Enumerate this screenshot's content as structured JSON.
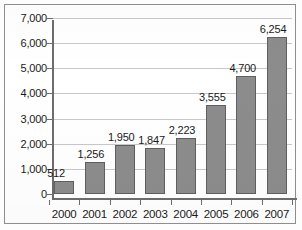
{
  "chart_data": {
    "type": "bar",
    "title": "",
    "xlabel": "",
    "ylabel": "",
    "categories": [
      "2000",
      "2001",
      "2002",
      "2003",
      "2004",
      "2005",
      "2006",
      "2007"
    ],
    "values": [
      512,
      1256,
      1950,
      1847,
      2223,
      3555,
      4700,
      6254
    ],
    "data_labels": [
      "512",
      "1,256",
      "1,950",
      "1,847",
      "2,223",
      "3,555",
      "4,700",
      "6,254"
    ],
    "ylim": [
      0,
      7000
    ],
    "ytick_values": [
      0,
      1000,
      2000,
      3000,
      4000,
      5000,
      6000,
      7000
    ],
    "ytick_labels": [
      "0",
      "1,000",
      "2,000",
      "3,000",
      "4,000",
      "5,000",
      "6,000",
      "7,000"
    ],
    "grid": true,
    "grid_axis": "y",
    "legend": false,
    "legend_position": "none",
    "series": [
      {
        "name": "",
        "values": [
          512,
          1256,
          1950,
          1847,
          2223,
          3555,
          4700,
          6254
        ]
      }
    ],
    "colors": {
      "bar_fill": "#8c8c8c",
      "bar_border": "#5f5f5f",
      "gridline": "#c8c8c8",
      "axis": "#6d6d6d",
      "text": "#1a1a1a",
      "background": "#ffffff",
      "frame_border": "#8e8e8e"
    }
  }
}
